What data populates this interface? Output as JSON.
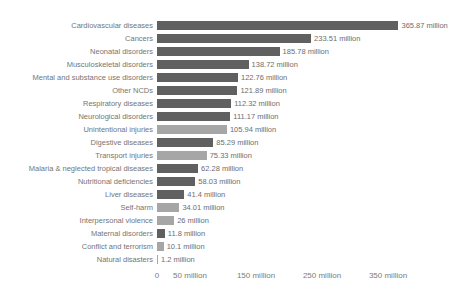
{
  "chart_data": {
    "type": "bar",
    "orientation": "horizontal",
    "title": "",
    "xlabel": "",
    "ylabel": "",
    "unit": "million",
    "xlim": [
      0,
      350
    ],
    "grid": false,
    "legend": "none",
    "categories": [
      "Cardiovascular diseases",
      "Cancers",
      "Neonatal disorders",
      "Musculoskeletal disorders",
      "Mental and substance use disorders",
      "Other NCDs",
      "Respiratory diseases",
      "Neurological disorders",
      "Unintentional injuries",
      "Digestive diseases",
      "Transport injuries",
      "Malaria & neglected tropical diseases",
      "Nutritional deficiencies",
      "Liver diseases",
      "Self-harm",
      "Interpersonal violence",
      "Maternal disorders",
      "Conflict and terrorism",
      "Natural disasters"
    ],
    "values": [
      365.87,
      233.51,
      185.78,
      138.72,
      122.76,
      121.89,
      112.32,
      111.17,
      105.94,
      85.29,
      75.33,
      62.28,
      58.03,
      41.4,
      34.01,
      26,
      11.8,
      10.1,
      1.2
    ],
    "value_labels": [
      "365.87 million",
      "233.51 million",
      "185.78 million",
      "138.72 million",
      "122.76 million",
      "121.89 million",
      "112.32 million",
      "111.17 million",
      "105.94 million",
      "85.29 million",
      "75.33 million",
      "62.28 million",
      "58.03 million",
      "41.4 million",
      "34.01 million",
      "26 million",
      "11.8 million",
      "10.1 million",
      "1.2 million"
    ],
    "bar_shades": [
      "dark",
      "dark",
      "dark",
      "dark",
      "dark",
      "dark",
      "dark",
      "dark",
      "light",
      "dark",
      "light",
      "dark",
      "dark",
      "dark",
      "light",
      "light",
      "dark",
      "light",
      "light"
    ],
    "axis_ticks": [
      {
        "label": "0",
        "value": 0
      },
      {
        "label": "50 million",
        "value": 50
      },
      {
        "label": "150 million",
        "value": 150
      },
      {
        "label": "250 million",
        "value": 250
      },
      {
        "label": "350 million",
        "value": 350
      }
    ]
  },
  "colors": {
    "bar_dark": "#606060",
    "bar_light": "#a6a6a6",
    "label_text": "#757575",
    "value_text": "#6e6e6e",
    "axis_text": "#7b7b7b",
    "background": "#ffffff"
  }
}
